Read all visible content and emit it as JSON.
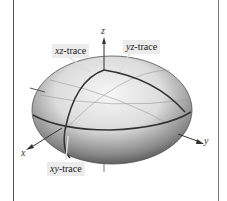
{
  "figure": {
    "type": "ellipsoid-traces",
    "labels": {
      "xz_trace": {
        "var": "xz",
        "suffix": "-trace"
      },
      "yz_trace": {
        "var": "yz",
        "suffix": "-trace"
      },
      "xy_trace": {
        "var": "xy",
        "suffix": "-trace"
      }
    },
    "axes": {
      "x": "x",
      "y": "y",
      "z": "z"
    },
    "colors": {
      "surface_light": "#f4f4f4",
      "surface_dark": "#3a3a3a",
      "trace": "#333333",
      "frame": "#555555"
    }
  }
}
